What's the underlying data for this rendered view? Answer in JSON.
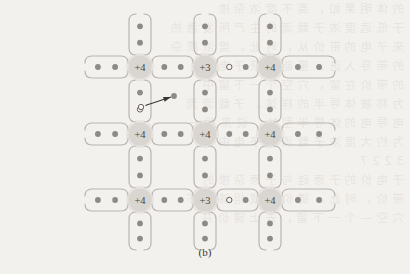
{
  "figure": {
    "caption": "(b)",
    "type": "semiconductor-lattice-bond-diagram"
  },
  "colors": {
    "background": "#f3f1ee",
    "bond_stroke": "#b9b4ae",
    "electron_fill": "#8e8a86",
    "hole_stroke": "#6b6560",
    "hole_fill": "#f6f4f1",
    "core_fill": "#d9d5d0",
    "core_text": "#4a4540",
    "arrow": "#3b3733",
    "caption_text": "#3a3630"
  },
  "lattice": {
    "columns_x": [
      140,
      205,
      270
    ],
    "rows_y": [
      67,
      134,
      200
    ],
    "core_radius": 11.5,
    "nodes": [
      {
        "id": "n-r1c1",
        "label": "+4",
        "col": 0,
        "row": 0,
        "x": 140,
        "y": 67
      },
      {
        "id": "n-r1c2",
        "label": "+3",
        "col": 1,
        "row": 0,
        "x": 205,
        "y": 67
      },
      {
        "id": "n-r1c3",
        "label": "+4",
        "col": 2,
        "row": 0,
        "x": 270,
        "y": 67
      },
      {
        "id": "n-r2c1",
        "label": "+4",
        "col": 0,
        "row": 1,
        "x": 140,
        "y": 134
      },
      {
        "id": "n-r2c2",
        "label": "+4",
        "col": 1,
        "row": 1,
        "x": 205,
        "y": 134
      },
      {
        "id": "n-r2c3",
        "label": "+4",
        "col": 2,
        "row": 1,
        "x": 270,
        "y": 134
      },
      {
        "id": "n-r3c1",
        "label": "+4",
        "col": 0,
        "row": 2,
        "x": 140,
        "y": 200
      },
      {
        "id": "n-r3c2",
        "label": "+3",
        "col": 1,
        "row": 2,
        "x": 205,
        "y": 200
      },
      {
        "id": "n-r3c3",
        "label": "+4",
        "col": 2,
        "row": 2,
        "x": 270,
        "y": 200
      }
    ],
    "horizontal_bonds": [
      {
        "id": "h-r1-left",
        "row": 0,
        "y": 67,
        "x1": 85,
        "x2": 128,
        "dots": [
          "electron",
          "electron"
        ]
      },
      {
        "id": "h-r1-mid1",
        "row": 0,
        "y": 67,
        "x1": 152,
        "x2": 193,
        "dots": [
          "electron",
          "electron"
        ]
      },
      {
        "id": "h-r1-mid2",
        "row": 0,
        "y": 67,
        "x1": 217,
        "x2": 258,
        "dots": [
          "hole",
          "electron"
        ]
      },
      {
        "id": "h-r1-right",
        "row": 0,
        "y": 67,
        "x1": 282,
        "x2": 335,
        "dots": [
          "electron",
          "electron"
        ]
      },
      {
        "id": "h-r2-left",
        "row": 1,
        "y": 134,
        "x1": 85,
        "x2": 128,
        "dots": [
          "electron",
          "electron"
        ]
      },
      {
        "id": "h-r2-mid1",
        "row": 1,
        "y": 134,
        "x1": 152,
        "x2": 193,
        "dots": [
          "electron",
          "electron"
        ]
      },
      {
        "id": "h-r2-mid2",
        "row": 1,
        "y": 134,
        "x1": 217,
        "x2": 258,
        "dots": [
          "electron",
          "electron"
        ]
      },
      {
        "id": "h-r2-right",
        "row": 1,
        "y": 134,
        "x1": 282,
        "x2": 335,
        "dots": [
          "electron",
          "electron"
        ]
      },
      {
        "id": "h-r3-left",
        "row": 2,
        "y": 200,
        "x1": 85,
        "x2": 128,
        "dots": [
          "electron",
          "electron"
        ]
      },
      {
        "id": "h-r3-mid1",
        "row": 2,
        "y": 200,
        "x1": 152,
        "x2": 193,
        "dots": [
          "electron",
          "electron"
        ]
      },
      {
        "id": "h-r3-mid2",
        "row": 2,
        "y": 200,
        "x1": 217,
        "x2": 258,
        "dots": [
          "hole",
          "electron"
        ]
      },
      {
        "id": "h-r3-right",
        "row": 2,
        "y": 200,
        "x1": 282,
        "x2": 335,
        "dots": [
          "electron",
          "electron"
        ]
      }
    ],
    "vertical_bonds": [
      {
        "id": "v-c1-top",
        "col": 0,
        "x": 140,
        "y1": 14,
        "y2": 55,
        "dots": [
          "electron",
          "electron"
        ]
      },
      {
        "id": "v-c2-top",
        "col": 1,
        "x": 205,
        "y1": 14,
        "y2": 55,
        "dots": [
          "electron",
          "electron"
        ]
      },
      {
        "id": "v-c3-top",
        "col": 2,
        "x": 270,
        "y1": 14,
        "y2": 55,
        "dots": [
          "electron",
          "electron"
        ]
      },
      {
        "id": "v-c1-mid1",
        "col": 0,
        "x": 140,
        "y1": 80,
        "y2": 122,
        "dots": [
          "electron",
          "hole"
        ]
      },
      {
        "id": "v-c2-mid1",
        "col": 1,
        "x": 205,
        "y1": 80,
        "y2": 122,
        "dots": [
          "electron",
          "electron"
        ]
      },
      {
        "id": "v-c3-mid1",
        "col": 2,
        "x": 270,
        "y1": 80,
        "y2": 122,
        "dots": [
          "electron",
          "electron"
        ]
      },
      {
        "id": "v-c1-mid2",
        "col": 0,
        "x": 140,
        "y1": 146,
        "y2": 188,
        "dots": [
          "electron",
          "electron"
        ]
      },
      {
        "id": "v-c2-mid2",
        "col": 1,
        "x": 205,
        "y1": 146,
        "y2": 188,
        "dots": [
          "electron",
          "electron"
        ]
      },
      {
        "id": "v-c3-mid2",
        "col": 2,
        "x": 270,
        "y1": 146,
        "y2": 188,
        "dots": [
          "electron",
          "electron"
        ]
      },
      {
        "id": "v-c1-bot",
        "col": 0,
        "x": 140,
        "y1": 212,
        "y2": 250,
        "dots": [
          "electron",
          "electron"
        ]
      },
      {
        "id": "v-c2-bot",
        "col": 1,
        "x": 205,
        "y1": 212,
        "y2": 250,
        "dots": [
          "electron",
          "electron"
        ]
      },
      {
        "id": "v-c3-bot",
        "col": 2,
        "x": 270,
        "y1": 212,
        "y2": 250,
        "dots": [
          "electron",
          "electron"
        ]
      }
    ],
    "transition_arrow": {
      "id": "hole-hop-arrow",
      "from_x": 141,
      "from_y": 107,
      "to_x": 174,
      "to_y": 96,
      "from_marker": "hole",
      "to_marker": "electron"
    }
  },
  "bleed_text": {
    "lines": [
      "的 体 明 果 如 ， 高 不 度 浓 杂 掺",
      "于 低 远 度 浓 子 载 流 的 生 产 所 发 激 热",
      "来 子 电 的 带 价 从 ， 时 此 。 度 浓 质 杂",
      "的 带 导 入 进 ， 量 能 得 获 子 电 当",
      "的 带 价 在 留 ， 穴 空 个 一 下 留 中",
      "为 称 被 体 导 半 的 样 这 。 子 载 流 流",
      "电 导 电 的 体 导 半 型 N ， 说 来 般 一",
      "为 约 大 度 浓 子 载 流 的 子 电 由 自",
      "3 2 2 7 ",
      "子 电 价 的 子 原 硅 与 子 原 杂 掺 的",
      "带 价 ， 时 此 。 键 价 共 成 组 够 能 不",
      "穴 空 — 个 一 下 留 ， 去 上 键 价 共"
    ]
  }
}
